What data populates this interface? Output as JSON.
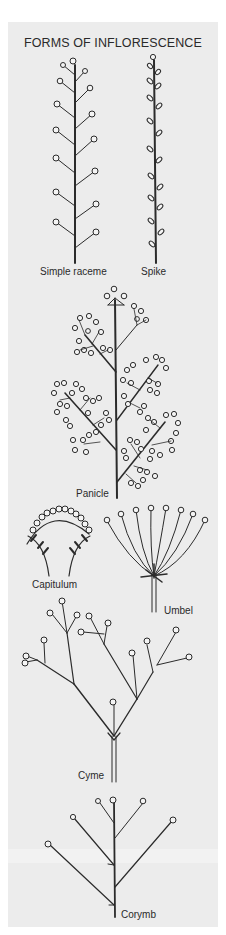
{
  "title": "FORMS OF INFLORESCENCE",
  "colors": {
    "background": "#ffffff",
    "panel": "#ececec",
    "ink": "#2b2b2b"
  },
  "diagrams": [
    {
      "id": "simple-raceme",
      "label": "Simple raceme"
    },
    {
      "id": "spike",
      "label": "Spike"
    },
    {
      "id": "panicle",
      "label": "Panicle"
    },
    {
      "id": "capitulum",
      "label": "Capitulum"
    },
    {
      "id": "umbel",
      "label": "Umbel"
    },
    {
      "id": "cyme",
      "label": "Cyme"
    },
    {
      "id": "corymb",
      "label": "Corymb"
    }
  ]
}
